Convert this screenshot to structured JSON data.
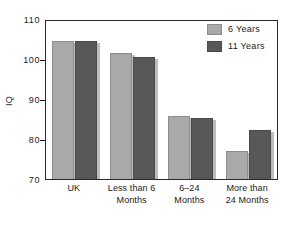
{
  "chart_data": {
    "type": "bar",
    "title": "",
    "subtitle": "",
    "xlabel": "",
    "ylabel": "IQ",
    "ylim": [
      70,
      110
    ],
    "yticks": [
      70,
      80,
      90,
      100,
      110
    ],
    "ytick_labels": [
      "70",
      "80",
      "90",
      "100",
      "110"
    ],
    "grid": false,
    "legend_position": "top-right",
    "categories": [
      "UK",
      "Less than 6 Months",
      "6–24 Months",
      "More than 24 Months"
    ],
    "category_lines": [
      [
        "UK",
        ""
      ],
      [
        "Less than 6",
        "Months"
      ],
      [
        "6–24",
        "Months"
      ],
      [
        "More than",
        "24 Months"
      ]
    ],
    "series": [
      {
        "name": "6 Years",
        "color": "#a9a9a9",
        "values": [
          105,
          102,
          86,
          77
        ]
      },
      {
        "name": "11 Years",
        "color": "#585858",
        "values": [
          105,
          100.8,
          85.5,
          82.5
        ]
      }
    ]
  },
  "legend": {
    "items": [
      {
        "label": "6 Years",
        "color": "#a9a9a9"
      },
      {
        "label": "11 Years",
        "color": "#585858"
      }
    ]
  },
  "axes": {
    "y_label": "IQ",
    "y_tick_labels": [
      "110",
      "100",
      "90",
      "80",
      "70"
    ]
  },
  "colors": {
    "series_light": "#a9a9a9",
    "series_dark": "#585858",
    "axis": "#2a2a2a",
    "text": "#1a1a1a",
    "background": "#ffffff"
  }
}
